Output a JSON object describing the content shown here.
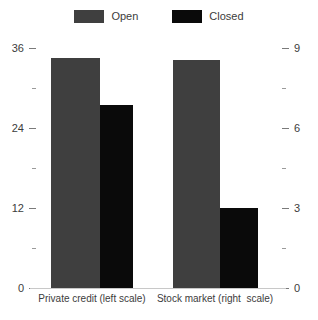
{
  "chart_data": {
    "type": "bar",
    "title": "",
    "subtitle": "",
    "xlabel": "",
    "ylabel": "",
    "categories": [
      "Private credit (left scale)",
      "Stock market (right  scale)"
    ],
    "series": [
      {
        "name": "Open",
        "color": "#3f3f3f",
        "values": [
          34.5,
          8.55
        ]
      },
      {
        "name": "Closed",
        "color": "#0a0a0a",
        "values": [
          27.5,
          3.0
        ]
      }
    ],
    "axes": {
      "left": {
        "label": "",
        "applies_to": "Private credit (left scale)",
        "ylim": [
          0,
          36
        ],
        "major_ticks": [
          0,
          12,
          24,
          36
        ],
        "major_tick_labels": [
          "0",
          "12",
          "24",
          "36"
        ],
        "minor_ticks": [
          6,
          18,
          30
        ]
      },
      "right": {
        "label": "",
        "applies_to": "Stock market (right  scale)",
        "ylim": [
          0,
          9
        ],
        "major_ticks": [
          0,
          3,
          6,
          9
        ],
        "major_tick_labels": [
          "0",
          "3",
          "6",
          "9"
        ],
        "minor_ticks": [
          1.5,
          4.5,
          7.5
        ]
      }
    },
    "grid": false,
    "legend": {
      "position": "top-center",
      "entries": [
        "Open",
        "Closed"
      ]
    }
  },
  "legend": {
    "entries": [
      {
        "label": "Open",
        "color": "#3f3f3f",
        "swatch_name": "legend-swatch-open"
      },
      {
        "label": "Closed",
        "color": "#0a0a0a",
        "swatch_name": "legend-swatch-closed"
      }
    ]
  },
  "axis_left": {
    "ticks": [
      {
        "label": "36",
        "major": true
      },
      {
        "label": "30",
        "major": false
      },
      {
        "label": "24",
        "major": true
      },
      {
        "label": "18",
        "major": false
      },
      {
        "label": "12",
        "major": true
      },
      {
        "label": "6",
        "major": false
      },
      {
        "label": "0",
        "major": true
      }
    ]
  },
  "axis_right": {
    "ticks": [
      {
        "label": "9",
        "major": true
      },
      {
        "label": "7.5",
        "major": false
      },
      {
        "label": "6",
        "major": true
      },
      {
        "label": "4.5",
        "major": false
      },
      {
        "label": "3",
        "major": true
      },
      {
        "label": "1.5",
        "major": false
      },
      {
        "label": "0",
        "major": true
      }
    ]
  },
  "groups": [
    {
      "label": "Private credit (left scale)"
    },
    {
      "label": "Stock market (right  scale)"
    }
  ]
}
